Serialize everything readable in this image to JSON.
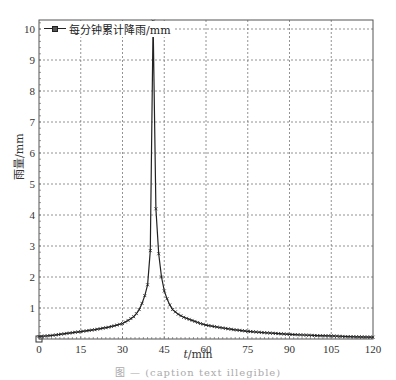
{
  "chart_data": {
    "type": "line",
    "title": "",
    "xlabel_var": "t",
    "xlabel_unit": "/min",
    "ylabel": "雨量/mm",
    "xlim": [
      0,
      120
    ],
    "ylim": [
      0,
      10.3
    ],
    "xticks": [
      0,
      15,
      30,
      45,
      60,
      75,
      90,
      105,
      120
    ],
    "yticks": [
      1,
      2,
      3,
      4,
      5,
      6,
      7,
      8,
      9,
      10
    ],
    "grid": true,
    "legend_position": "upper-left",
    "series": [
      {
        "name": "每分钟累计降雨/mm",
        "color": "#222222",
        "marker": "x",
        "x": [
          0,
          5,
          10,
          15,
          20,
          25,
          28,
          30,
          32,
          34,
          35,
          36,
          37,
          38,
          39,
          40,
          41,
          42,
          43,
          44,
          45,
          46,
          47,
          48,
          50,
          52,
          55,
          58,
          60,
          65,
          70,
          75,
          80,
          85,
          90,
          95,
          100,
          105,
          110,
          115,
          120
        ],
        "values": [
          0.08,
          0.12,
          0.18,
          0.24,
          0.3,
          0.38,
          0.45,
          0.5,
          0.6,
          0.72,
          0.82,
          0.95,
          1.15,
          1.4,
          1.75,
          2.85,
          10.25,
          4.2,
          2.75,
          2.0,
          1.55,
          1.3,
          1.1,
          0.95,
          0.8,
          0.7,
          0.6,
          0.5,
          0.45,
          0.37,
          0.3,
          0.25,
          0.21,
          0.18,
          0.15,
          0.13,
          0.11,
          0.1,
          0.08,
          0.07,
          0.06
        ]
      }
    ]
  },
  "legend": {
    "label": "每分钟累计降雨/mm"
  },
  "axes": {
    "ylabel": "雨量/mm",
    "xlabel_var": "t",
    "xlabel_unit": "/min"
  },
  "caption": "图 — (caption text illegible)"
}
